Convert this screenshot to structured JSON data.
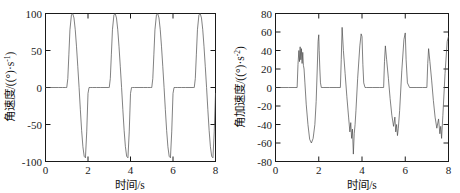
{
  "figure": {
    "background": "#ffffff",
    "line_color": "#4a4a4a",
    "axis_color": "#1a1a1a"
  },
  "chart_data": [
    {
      "type": "line",
      "panel": "left",
      "title": "",
      "xlabel_cn": "时间",
      "xlabel_unit": "/s",
      "xlabel_full": "时间/s",
      "ylabel_cn": "角速度",
      "ylabel_unit": "/((°)·s⁻¹)",
      "ylabel_full": "角速度/((°)·s⁻¹)",
      "ylabel_sup": "-1",
      "xlim": [
        0,
        8
      ],
      "ylim": [
        -100,
        100
      ],
      "xticks": [
        0,
        2,
        4,
        6,
        8
      ],
      "xticklabels": [
        "0",
        "2",
        "4",
        "6",
        "8"
      ],
      "yticks": [
        -100,
        -50,
        0,
        50,
        100
      ],
      "yticklabels": [
        "-100",
        "-50",
        "0",
        "50",
        "100"
      ],
      "grid": false,
      "legend": null,
      "period": 2.0,
      "cycles": 4,
      "peak_positive": 100,
      "peak_negative": -95,
      "series": [
        {
          "name": "angular velocity",
          "x": [
            0.0,
            0.2,
            0.4,
            0.6,
            0.8,
            0.95,
            1.0,
            1.05,
            1.1,
            1.15,
            1.22,
            1.28,
            1.34,
            1.4,
            1.46,
            1.52,
            1.58,
            1.64,
            1.7,
            1.76,
            1.82,
            1.88,
            1.94,
            2.0,
            2.05,
            2.1,
            2.2,
            2.4,
            2.6,
            2.8,
            2.95,
            3.0,
            3.05,
            3.1,
            3.15,
            3.22,
            3.28,
            3.34,
            3.4,
            3.46,
            3.52,
            3.58,
            3.64,
            3.7,
            3.76,
            3.82,
            3.88,
            3.94,
            4.0,
            4.05,
            4.1,
            4.2,
            4.4,
            4.6,
            4.8,
            4.95,
            5.0,
            5.05,
            5.1,
            5.15,
            5.22,
            5.28,
            5.34,
            5.4,
            5.46,
            5.52,
            5.58,
            5.64,
            5.7,
            5.76,
            5.82,
            5.88,
            5.94,
            6.0,
            6.05,
            6.1,
            6.2,
            6.4,
            6.6,
            6.8,
            6.95,
            7.0,
            7.05,
            7.1,
            7.15,
            7.22,
            7.28,
            7.34,
            7.4,
            7.46,
            7.52,
            7.58,
            7.64,
            7.7,
            7.76,
            7.82,
            7.88,
            7.94,
            8.0
          ],
          "y": [
            0,
            0,
            0,
            0,
            0,
            0,
            0,
            12,
            45,
            78,
            98,
            100,
            94,
            78,
            55,
            28,
            0,
            -30,
            -58,
            -80,
            -93,
            -95,
            -60,
            -8,
            0,
            0,
            0,
            0,
            0,
            0,
            0,
            0,
            12,
            45,
            78,
            98,
            100,
            94,
            78,
            55,
            28,
            0,
            -30,
            -58,
            -80,
            -93,
            -95,
            -60,
            -8,
            0,
            0,
            0,
            0,
            0,
            0,
            0,
            0,
            12,
            45,
            78,
            98,
            100,
            94,
            78,
            55,
            28,
            0,
            -30,
            -58,
            -80,
            -93,
            -95,
            -60,
            -8,
            0,
            0,
            0,
            0,
            0,
            0,
            0,
            0,
            12,
            45,
            78,
            98,
            100,
            94,
            78,
            55,
            28,
            0,
            -30,
            -58,
            -80,
            -93,
            -95,
            -60,
            -8,
            0
          ]
        }
      ]
    },
    {
      "type": "line",
      "panel": "right",
      "title": "",
      "xlabel_cn": "时间",
      "xlabel_unit": "/s",
      "xlabel_full": "时间/s",
      "ylabel_cn": "角加速度",
      "ylabel_unit": "/((°)·s⁻²)",
      "ylabel_full": "角加速度/((°)·s⁻²)",
      "ylabel_sup": "-2",
      "xlim": [
        0,
        8
      ],
      "ylim": [
        -80,
        80
      ],
      "xticks": [
        0,
        2,
        4,
        6,
        8
      ],
      "xticklabels": [
        "0",
        "2",
        "4",
        "6",
        "8"
      ],
      "yticks": [
        -80,
        -60,
        -40,
        -20,
        0,
        20,
        40,
        60,
        80
      ],
      "yticklabels": [
        "-80",
        "-60",
        "-40",
        "-20",
        "0",
        "20",
        "40",
        "60",
        "80"
      ],
      "grid": false,
      "legend": null,
      "period": 2.0,
      "cycles": 4,
      "peak_positive": 65,
      "peak_negative": -72,
      "noise_note": "high-frequency oscillation bursts at transition peaks",
      "series": [
        {
          "name": "angular acceleration",
          "x": [
            0.0,
            0.3,
            0.6,
            0.9,
            1.0,
            1.04,
            1.08,
            1.11,
            1.14,
            1.17,
            1.2,
            1.23,
            1.26,
            1.29,
            1.32,
            1.36,
            1.42,
            1.5,
            1.58,
            1.66,
            1.74,
            1.82,
            1.88,
            1.93,
            1.97,
            2.0,
            2.02,
            2.05,
            2.08,
            2.12,
            2.2,
            2.5,
            2.8,
            3.0,
            3.04,
            3.08,
            3.14,
            3.22,
            3.3,
            3.38,
            3.44,
            3.48,
            3.52,
            3.56,
            3.6,
            3.64,
            3.68,
            3.72,
            3.8,
            3.9,
            3.96,
            4.0,
            4.04,
            4.08,
            4.14,
            4.2,
            4.5,
            4.8,
            5.0,
            5.04,
            5.08,
            5.14,
            5.22,
            5.3,
            5.38,
            5.46,
            5.52,
            5.56,
            5.6,
            5.64,
            5.68,
            5.74,
            5.84,
            5.94,
            6.0,
            6.04,
            6.1,
            6.2,
            6.5,
            6.8,
            7.0,
            7.04,
            7.08,
            7.14,
            7.22,
            7.3,
            7.38,
            7.46,
            7.54,
            7.6,
            7.64,
            7.68,
            7.74,
            7.84,
            7.94,
            8.0
          ],
          "y": [
            0,
            0,
            0,
            0,
            0,
            25,
            40,
            28,
            44,
            30,
            42,
            26,
            38,
            24,
            20,
            5,
            -18,
            -40,
            -56,
            -60,
            -55,
            -40,
            -15,
            20,
            50,
            57,
            40,
            20,
            5,
            0,
            0,
            0,
            0,
            0,
            30,
            65,
            40,
            15,
            -10,
            -32,
            -48,
            -38,
            -55,
            -45,
            -72,
            -50,
            -40,
            -25,
            10,
            45,
            58,
            55,
            25,
            5,
            0,
            0,
            0,
            0,
            0,
            28,
            45,
            30,
            10,
            -12,
            -30,
            -42,
            -32,
            -48,
            -40,
            -52,
            -44,
            -25,
            18,
            52,
            59,
            30,
            5,
            0,
            0,
            0,
            0,
            26,
            42,
            28,
            8,
            -14,
            -32,
            -44,
            -34,
            -50,
            -42,
            -55,
            -30,
            15,
            50,
            55
          ]
        }
      ]
    }
  ]
}
